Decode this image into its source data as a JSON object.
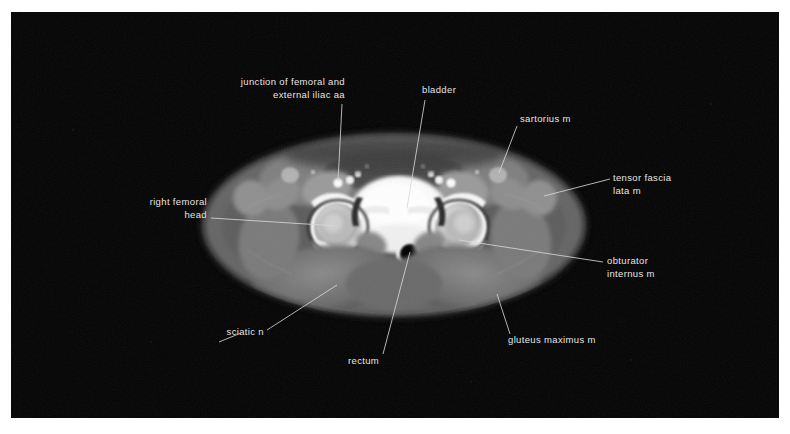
{
  "figure": {
    "modality": "CT",
    "plane": "axial",
    "region": "pelvis",
    "background_color": "#030303",
    "page_color": "#ffffff",
    "label_color": "#e8e8e8",
    "leader_color": "#d8d8d8"
  },
  "annotations": [
    {
      "id": "junction-femoral-external-iliac-aa",
      "name": "junction of femoral and external iliac aa",
      "lines": [
        "junction of femoral and",
        "external iliac aa"
      ],
      "align": "right",
      "text_right": 334,
      "text_top": 64,
      "leader": [
        [
          331,
          92
        ],
        [
          327,
          170
        ]
      ]
    },
    {
      "id": "bladder",
      "name": "bladder",
      "lines": [
        "bladder"
      ],
      "align": "left",
      "text_left": 411,
      "text_top": 72,
      "leader": [
        [
          414,
          88
        ],
        [
          396,
          196
        ]
      ]
    },
    {
      "id": "sartorius-m",
      "name": "sartorius m",
      "lines": [
        "sartorius m"
      ],
      "align": "left",
      "text_left": 509,
      "text_top": 101,
      "leader": [
        [
          506,
          114
        ],
        [
          488,
          161
        ]
      ]
    },
    {
      "id": "tensor-fascia-lata-m",
      "name": "tensor fascia lata m",
      "lines": [
        "tensor fascia",
        "lata m"
      ],
      "align": "left",
      "text_left": 602,
      "text_top": 160,
      "leader": [
        [
          599,
          167
        ],
        [
          533,
          184
        ]
      ]
    },
    {
      "id": "right-femoral-head",
      "name": "right femoral head",
      "lines": [
        "right femoral",
        "head"
      ],
      "align": "right",
      "text_right": 196,
      "text_top": 184,
      "leader": [
        [
          200,
          206
        ],
        [
          327,
          214
        ]
      ]
    },
    {
      "id": "obturator-internus-m",
      "name": "obturator internus m",
      "lines": [
        "obturator",
        "internus m"
      ],
      "align": "left",
      "text_left": 596,
      "text_top": 243,
      "leader": [
        [
          592,
          250
        ],
        [
          448,
          228
        ]
      ]
    },
    {
      "id": "sciatic-n",
      "name": "sciatic n",
      "lines": [
        "sciatic n"
      ],
      "align": "right",
      "text_right": 253,
      "text_top": 314,
      "leader": [
        [
          256,
          318
        ],
        [
          326,
          273
        ]
      ],
      "leader2": [
        [
          208,
          330
        ],
        [
          230,
          321
        ]
      ]
    },
    {
      "id": "gluteus-maximus-m",
      "name": "gluteus maximus m",
      "lines": [
        "gluteus maximus m"
      ],
      "align": "left",
      "text_left": 497,
      "text_top": 322,
      "leader": [
        [
          499,
          322
        ],
        [
          486,
          282
        ]
      ]
    },
    {
      "id": "rectum",
      "name": "rectum",
      "lines": [
        "rectum"
      ],
      "align": "left",
      "text_left": 337,
      "text_top": 343,
      "leader": [
        [
          372,
          342
        ],
        [
          399,
          240
        ]
      ]
    }
  ]
}
